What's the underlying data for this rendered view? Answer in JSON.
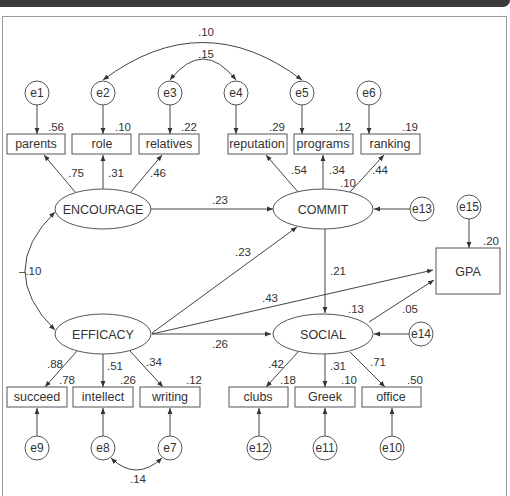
{
  "diagram": {
    "type": "structural-equation-path-diagram",
    "latent_variables": [
      {
        "id": "encourage",
        "label": "ENCOURAGE"
      },
      {
        "id": "commit",
        "label": "COMMIT"
      },
      {
        "id": "efficacy",
        "label": "EFFICACY"
      },
      {
        "id": "social",
        "label": "SOCIAL"
      }
    ],
    "observed_variables": {
      "top": [
        {
          "label": "parents",
          "r2": ".56",
          "loading": ".75",
          "error": "e1"
        },
        {
          "label": "role",
          "r2": ".10",
          "loading": ".31",
          "error": "e2"
        },
        {
          "label": "relatives",
          "r2": ".22",
          "loading": ".46",
          "error": "e3"
        },
        {
          "label": "reputation",
          "r2": ".29",
          "loading": ".54",
          "error": "e4"
        },
        {
          "label": "programs",
          "r2": ".12",
          "loading": ".34",
          "error": "e5"
        },
        {
          "label": "ranking",
          "r2": ".19",
          "loading": ".44",
          "error": "e6"
        }
      ],
      "bottom": [
        {
          "label": "succeed",
          "r2": ".78",
          "loading": ".88",
          "error": "e9"
        },
        {
          "label": "intellect",
          "r2": ".26",
          "loading": ".51",
          "error": "e8"
        },
        {
          "label": "writing",
          "r2": ".12",
          "loading": ".34",
          "error": "e7"
        },
        {
          "label": "clubs",
          "r2": ".18",
          "loading": ".42",
          "error": "e12"
        },
        {
          "label": "Greek",
          "r2": ".10",
          "loading": ".31",
          "error": "e11"
        },
        {
          "label": "office",
          "r2": ".50",
          "loading": ".71",
          "error": "e10"
        }
      ],
      "outcome": {
        "label": "GPA",
        "r2": ".20",
        "error": "e15"
      }
    },
    "disturbances": {
      "commit": "e13",
      "social": "e14",
      "gpa": "e15"
    },
    "commit_r2": ".10",
    "social_r2": ".13",
    "paths": [
      {
        "from": "ENCOURAGE",
        "to": "COMMIT",
        "value": ".23"
      },
      {
        "from": "EFFICACY",
        "to": "COMMIT",
        "value": ".23"
      },
      {
        "from": "EFFICACY",
        "to": "GPA",
        "value": ".43"
      },
      {
        "from": "EFFICACY",
        "to": "SOCIAL",
        "value": ".26"
      },
      {
        "from": "COMMIT",
        "to": "SOCIAL",
        "value": ".21"
      },
      {
        "from": "SOCIAL",
        "to": "GPA",
        "value": ".05"
      }
    ],
    "covariances": [
      {
        "between": [
          "e2",
          "e5"
        ],
        "value": ".10"
      },
      {
        "between": [
          "e3",
          "e4"
        ],
        "value": ".15"
      },
      {
        "between": [
          "ENCOURAGE",
          "EFFICACY"
        ],
        "value": "–.10"
      },
      {
        "between": [
          "e8",
          "e7"
        ],
        "value": ".14"
      }
    ]
  }
}
